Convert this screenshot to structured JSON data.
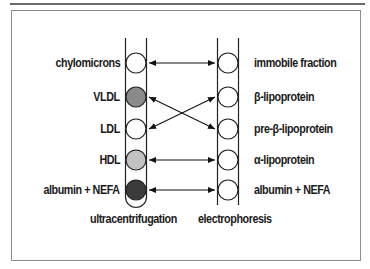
{
  "diagram": {
    "left_column": {
      "title": "ultracentrifugation",
      "items": [
        {
          "label": "chylomicrons",
          "fill": "#ffffff"
        },
        {
          "label": "VLDL",
          "fill": "#8a8a8a"
        },
        {
          "label": "LDL",
          "fill": "#ffffff"
        },
        {
          "label": "HDL",
          "fill": "#c2c2c2"
        },
        {
          "label": "albumin + NEFA",
          "fill": "#3b3b3b"
        }
      ]
    },
    "right_column": {
      "title": "electrophoresis",
      "items": [
        {
          "label": "immobile fraction"
        },
        {
          "label": "β-lipoprotein"
        },
        {
          "label": "pre-β-lipoprotein"
        },
        {
          "label": "α-lipoprotein"
        },
        {
          "label": "albumin + NEFA"
        }
      ]
    },
    "connections": [
      {
        "from": "chylomicrons",
        "to": "immobile fraction"
      },
      {
        "from": "VLDL",
        "to": "pre-β-lipoprotein"
      },
      {
        "from": "LDL",
        "to": "β-lipoprotein"
      },
      {
        "from": "HDL",
        "to": "α-lipoprotein"
      },
      {
        "from": "albumin + NEFA",
        "to": "albumin + NEFA"
      }
    ]
  }
}
